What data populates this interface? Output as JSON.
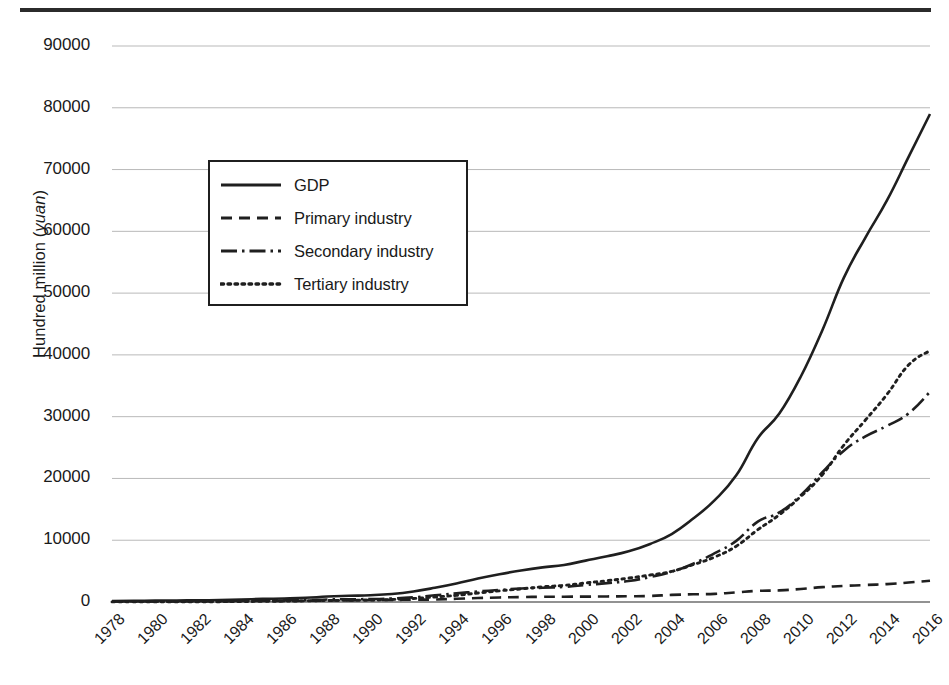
{
  "figure": {
    "has_top_rule": true,
    "background": "#ffffff",
    "line_color": "#1f1f1f",
    "grid_color": "#b9b9b9"
  },
  "axis": {
    "y_title_prefix": "Hundred million (",
    "y_title_italic": "yuan",
    "y_title_suffix": ")",
    "y_ticks": [
      "0",
      "10000",
      "20000",
      "30000",
      "40000",
      "50000",
      "60000",
      "70000",
      "80000",
      "90000"
    ],
    "x_ticks": [
      "1978",
      "1980",
      "1982",
      "1984",
      "1986",
      "1988",
      "1990",
      "1992",
      "1994",
      "1996",
      "1998",
      "2000",
      "2002",
      "2004",
      "2006",
      "2008",
      "2010",
      "2012",
      "2014",
      "2016"
    ]
  },
  "legend": {
    "items": [
      {
        "label": "GDP",
        "style": "solid"
      },
      {
        "label": "Primary industry",
        "style": "dashed"
      },
      {
        "label": "Secondary industry",
        "style": "dashdot"
      },
      {
        "label": "Tertiary industry",
        "style": "dotted"
      }
    ]
  },
  "chart_data": {
    "type": "line",
    "title": "",
    "xlabel": "",
    "ylabel": "Hundred million (yuan)",
    "xlim": [
      1978,
      2016
    ],
    "ylim": [
      0,
      90000
    ],
    "grid": "horizontal",
    "legend_position": "upper-left-inset",
    "x": [
      1978,
      1979,
      1980,
      1981,
      1982,
      1983,
      1984,
      1985,
      1986,
      1987,
      1988,
      1989,
      1990,
      1991,
      1992,
      1993,
      1994,
      1995,
      1996,
      1997,
      1998,
      1999,
      2000,
      2001,
      2002,
      2003,
      2004,
      2005,
      2006,
      2007,
      2008,
      2009,
      2010,
      2011,
      2012,
      2013,
      2014,
      2015,
      2016
    ],
    "series": [
      {
        "name": "GDP",
        "style": "solid",
        "values": [
          170,
          195,
          225,
          250,
          280,
          320,
          400,
          500,
          570,
          680,
          880,
          1000,
          1100,
          1300,
          1700,
          2300,
          3000,
          3800,
          4500,
          5100,
          5600,
          6000,
          6700,
          7400,
          8200,
          9400,
          11000,
          13500,
          16500,
          20500,
          26500,
          30500,
          36500,
          44000,
          52500,
          59000,
          65000,
          72000,
          79000
        ]
      },
      {
        "name": "Primary industry",
        "style": "dashed",
        "values": [
          70,
          78,
          82,
          95,
          115,
          130,
          150,
          165,
          175,
          195,
          240,
          270,
          320,
          340,
          370,
          410,
          520,
          640,
          740,
          800,
          840,
          860,
          870,
          900,
          930,
          980,
          1150,
          1250,
          1320,
          1560,
          1800,
          1880,
          2100,
          2400,
          2600,
          2750,
          2900,
          3150,
          3450
        ]
      },
      {
        "name": "Secondary industry",
        "style": "dashdot",
        "values": [
          80,
          92,
          105,
          110,
          120,
          140,
          175,
          225,
          255,
          300,
          400,
          450,
          470,
          560,
          760,
          1080,
          1400,
          1700,
          1950,
          2180,
          2300,
          2450,
          2750,
          3050,
          3400,
          4050,
          4900,
          6200,
          7900,
          9900,
          13000,
          14500,
          17300,
          21000,
          24500,
          26800,
          28500,
          30500,
          34000
        ]
      },
      {
        "name": "Tertiary industry",
        "style": "dotted",
        "values": [
          20,
          25,
          38,
          45,
          45,
          50,
          75,
          110,
          140,
          185,
          240,
          280,
          310,
          400,
          570,
          810,
          1080,
          1460,
          1810,
          2120,
          2460,
          2690,
          3080,
          3450,
          3870,
          4370,
          4950,
          6050,
          7280,
          9040,
          11700,
          14120,
          17100,
          20600,
          25400,
          29450,
          33600,
          38350,
          40700
        ]
      }
    ]
  }
}
